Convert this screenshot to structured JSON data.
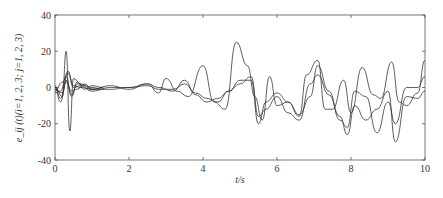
{
  "chart_data": {
    "type": "line",
    "title": "",
    "xlabel": "t/s",
    "ylabel": "e_ij (t)(i=1, 2, 3; j=1, 2, 3)",
    "xlim": [
      0,
      10
    ],
    "ylim": [
      -40,
      40
    ],
    "xticks": [
      0,
      2,
      4,
      6,
      8,
      10
    ],
    "yticks": [
      -40,
      -20,
      0,
      20,
      40
    ],
    "grid": false,
    "legend": null,
    "series": [
      {
        "name": "e_a",
        "x": [
          0,
          0.2,
          0.3,
          0.4,
          0.5,
          0.7,
          1,
          1.5,
          2,
          2.5,
          2.8,
          3,
          3.3,
          3.6,
          4,
          4.3,
          4.6,
          4.9,
          5.2,
          5.4,
          5.6,
          5.8,
          6,
          6.3,
          6.6,
          6.8,
          7.1,
          7.3,
          7.5,
          7.8,
          8,
          8.3,
          8.6,
          8.8,
          9.1,
          9.3,
          9.5,
          9.8,
          10
        ],
        "y": [
          0,
          -5,
          20,
          -24,
          5,
          2,
          -1,
          1,
          -1,
          2,
          -3,
          5,
          -2,
          -5,
          12,
          -8,
          -12,
          25,
          12,
          -5,
          -18,
          6,
          -10,
          -8,
          -16,
          7,
          15,
          -12,
          -12,
          4,
          -14,
          11,
          -4,
          -6,
          14,
          -8,
          -10,
          -3,
          15
        ]
      },
      {
        "name": "e_b",
        "x": [
          0,
          0.2,
          0.35,
          0.5,
          0.7,
          1,
          1.5,
          2,
          2.5,
          2.8,
          3.2,
          3.5,
          3.8,
          4.1,
          4.4,
          4.7,
          5,
          5.3,
          5.5,
          5.7,
          6,
          6.3,
          6.6,
          6.9,
          7.1,
          7.4,
          7.7,
          7.9,
          8.1,
          8.4,
          8.7,
          9,
          9.2,
          9.5,
          9.8,
          10
        ],
        "y": [
          -2,
          3,
          8,
          0,
          1,
          -2,
          0,
          0,
          2,
          0,
          -2,
          4,
          -4,
          -8,
          -6,
          -2,
          2,
          6,
          -16,
          -12,
          -5,
          -14,
          -18,
          2,
          7,
          -4,
          -16,
          -26,
          -10,
          -18,
          -12,
          -2,
          -30,
          -5,
          -6,
          -2
        ]
      },
      {
        "name": "e_c",
        "x": [
          0,
          0.2,
          0.35,
          0.5,
          0.7,
          1,
          1.5,
          2,
          2.5,
          2.8,
          3.2,
          3.5,
          3.8,
          4.1,
          4.4,
          4.7,
          5,
          5.3,
          5.5,
          5.7,
          6,
          6.3,
          6.6,
          6.9,
          7.1,
          7.4,
          7.7,
          7.9,
          8.1,
          8.4,
          8.7,
          9,
          9.2,
          9.5,
          9.8,
          10
        ],
        "y": [
          -1,
          -3,
          9,
          1,
          0,
          -1,
          -1,
          0,
          1,
          -1,
          -1,
          2,
          -3,
          -6,
          -8,
          -2,
          4,
          4,
          -20,
          -8,
          -3,
          -8,
          -15,
          -5,
          12,
          -2,
          -18,
          -22,
          -2,
          -5,
          -25,
          -8,
          -20,
          0,
          0,
          6
        ]
      },
      {
        "name": "e_d",
        "x": [
          0,
          0.15,
          0.3,
          0.45,
          0.6,
          0.8,
          1,
          1.3
        ],
        "y": [
          0,
          -8,
          4,
          -4,
          2,
          1,
          0,
          -1
        ]
      },
      {
        "name": "e_e",
        "x": [
          0,
          0.15,
          0.3,
          0.45,
          0.6,
          0.8,
          1,
          1.3
        ],
        "y": [
          -3,
          -2,
          6,
          -5,
          3,
          -1,
          1,
          0
        ]
      },
      {
        "name": "e_f",
        "x": [
          0,
          0.15,
          0.3,
          0.45,
          0.6,
          0.8,
          1,
          1.3
        ],
        "y": [
          1,
          -6,
          3,
          -2,
          -1,
          2,
          -1,
          0
        ]
      }
    ]
  }
}
